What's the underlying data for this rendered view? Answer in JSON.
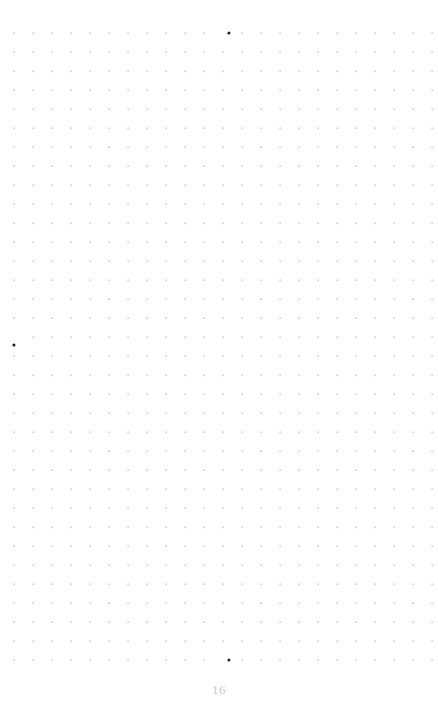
{
  "page": {
    "width": 438,
    "height": 713,
    "background_color": "#ffffff",
    "kind": "dot-grid-notebook-page",
    "page_number": "16",
    "page_number_color": "#c9c9cf",
    "page_number_position": {
      "x": 229,
      "y": 690
    }
  },
  "grid": {
    "origin_x": 14,
    "origin_y": 33,
    "spacing_x": 19,
    "spacing_y": 19,
    "columns": 23,
    "rows": 34,
    "dot_color": "#d6d6dc",
    "dot_diameter": 1.6
  },
  "emphasis_dots": {
    "color": "#1c1c1c",
    "diameter": 3.2,
    "points": [
      {
        "name": "top-marker",
        "col": 11,
        "row": 0,
        "x": 229,
        "y": 33
      },
      {
        "name": "left-marker",
        "col": 0,
        "row": 16,
        "x": 14,
        "y": 345
      },
      {
        "name": "bottom-marker",
        "col": 11,
        "row": 33,
        "x": 229,
        "y": 660
      }
    ]
  }
}
